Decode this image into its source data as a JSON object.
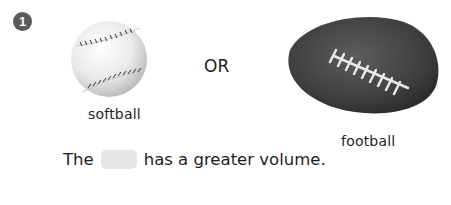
{
  "question": {
    "number": "1",
    "options": [
      {
        "id": "softball",
        "label": "softball",
        "image": "softball-photo"
      },
      {
        "id": "football",
        "label": "football",
        "image": "football-photo"
      }
    ],
    "separator": "OR",
    "sentence": {
      "before": "The",
      "blank": "",
      "after": "has a greater volume."
    }
  },
  "colors": {
    "badge": "#5a5a5a",
    "blank_fill": "#e6e6e6",
    "text": "#1e1e1e"
  }
}
